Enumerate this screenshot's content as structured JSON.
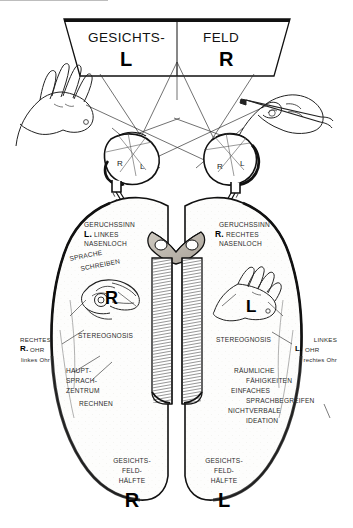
{
  "figure": {
    "title_banner": {
      "left_word": "GESICHTS-",
      "right_word": "FELD",
      "left_side_letter": "L",
      "right_side_letter": "R"
    },
    "eyes": {
      "left_eye": {
        "inner_left_label": "R",
        "inner_right_label": "L"
      },
      "right_eye": {
        "inner_left_label": "R",
        "inner_right_label": "L"
      }
    },
    "left_hemisphere": {
      "smell": {
        "line1": "GERUCHSSINN",
        "marker": "L.",
        "line2": "LINKES",
        "line3": "NASENLOCH"
      },
      "speech": {
        "line1": "SPRACHE",
        "line2": "SCHREIBEN"
      },
      "hand_letter": "R",
      "stereognosis": "STEREOGNOSIS",
      "ear": {
        "line1": "RECHTES",
        "marker": "R.",
        "marker_word": "OHR",
        "line2": "linkes Ohr"
      },
      "functions": {
        "line1": "HAUPT-",
        "line2": "SPRACH-",
        "line3": "ZENTRUM",
        "line4": "RECHNEN"
      },
      "visual_field": {
        "line1": "GESICHTS-",
        "line2": "FELD-",
        "line3": "HÄLFTE",
        "letter": "R"
      }
    },
    "right_hemisphere": {
      "smell": {
        "line1": "GERUCHSSINN",
        "marker": "R.",
        "line2": "RECHTES",
        "line3": "NASENLOCH"
      },
      "hand_letter": "L",
      "stereognosis": "STEREOGNOSIS",
      "ear": {
        "line1": "LINKES",
        "marker": "L.",
        "marker_word": "OHR",
        "line2": "rechtes Ohr"
      },
      "functions": {
        "line1": "RÄUMLICHE",
        "line2": "FÄHIGKEITEN",
        "line3": "EINFACHES",
        "line4": "SPRACHBEGREIFEN",
        "line5": "NICHTVERBALE",
        "line6": "IDEATION"
      },
      "visual_field": {
        "line1": "GESICHTS-",
        "line2": "FELD-",
        "line3": "HÄLFTE",
        "letter": "L"
      }
    },
    "icons": {
      "left_hand": "open-hand-icon",
      "right_hand": "hand-with-pencil-icon",
      "left_brain_hand": "hand-grasping-object-icon",
      "right_brain_hand": "open-hand-icon"
    },
    "colors": {
      "ink": "#1a1a1a",
      "paper": "#ffffff",
      "shade": "#c9c4bb"
    }
  }
}
